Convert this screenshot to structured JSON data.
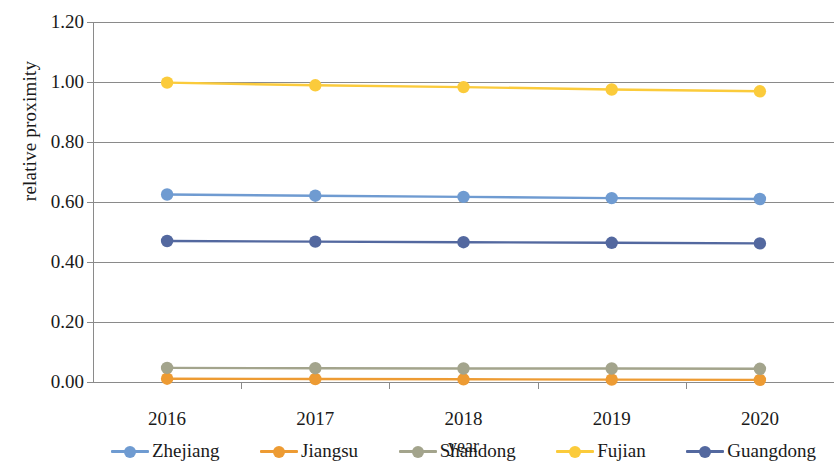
{
  "chart_data": {
    "type": "line",
    "title": "",
    "xlabel": "year",
    "ylabel": "relative proximity",
    "categories": [
      "2016",
      "2017",
      "2018",
      "2019",
      "2020"
    ],
    "ylim": [
      0.0,
      1.2
    ],
    "yticks": [
      "0.00",
      "0.20",
      "0.40",
      "0.60",
      "0.80",
      "1.00",
      "1.20"
    ],
    "ytick_values": [
      0.0,
      0.2,
      0.4,
      0.6,
      0.8,
      1.0,
      1.2
    ],
    "grid": "horizontal",
    "legend_position": "bottom",
    "series": [
      {
        "name": "Zhejiang",
        "color": "#6f9bd1",
        "values": [
          0.625,
          0.621,
          0.617,
          0.613,
          0.61
        ]
      },
      {
        "name": "Jiangsu",
        "color": "#ed9b33",
        "values": [
          0.011,
          0.01,
          0.009,
          0.008,
          0.007
        ]
      },
      {
        "name": "Shandong",
        "color": "#a3a48c",
        "values": [
          0.047,
          0.046,
          0.045,
          0.045,
          0.044
        ]
      },
      {
        "name": "Fujian",
        "color": "#fbcb3b",
        "values": [
          0.998,
          0.989,
          0.983,
          0.975,
          0.969
        ]
      },
      {
        "name": "Guangdong",
        "color": "#53689f",
        "values": [
          0.47,
          0.468,
          0.466,
          0.464,
          0.462
        ]
      }
    ]
  },
  "legend": {
    "items": [
      {
        "label": "Zhejiang"
      },
      {
        "label": "Jiangsu"
      },
      {
        "label": "Shandong"
      },
      {
        "label": "Fujian"
      },
      {
        "label": "Guangdong"
      }
    ]
  }
}
